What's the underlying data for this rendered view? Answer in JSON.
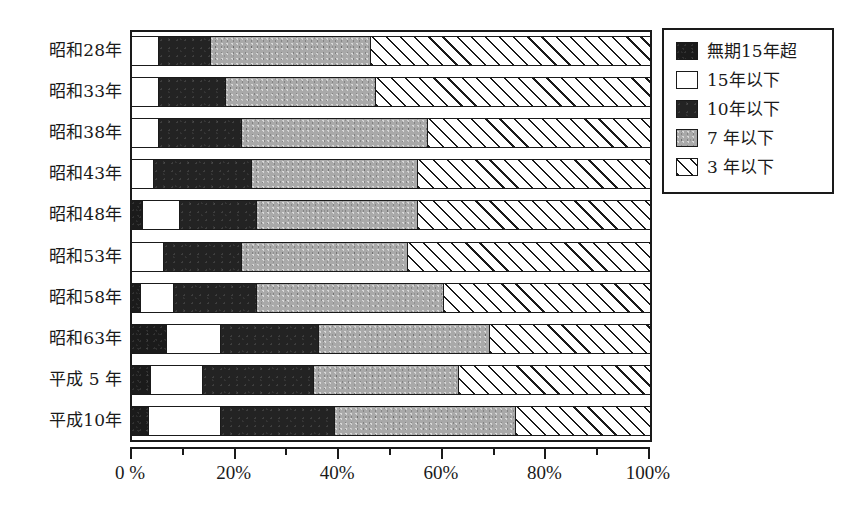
{
  "chart_data": {
    "type": "bar",
    "orientation": "horizontal",
    "stacked": true,
    "normalized_percent": true,
    "title": "",
    "xlabel": "",
    "ylabel": "",
    "xlim": [
      0,
      100
    ],
    "grid": false,
    "legend_position": "right",
    "categories": [
      "昭和28年",
      "昭和33年",
      "昭和38年",
      "昭和43年",
      "昭和48年",
      "昭和53年",
      "昭和58年",
      "昭和63年",
      "平成 5 年",
      "平成10年"
    ],
    "xticks": [
      0,
      20,
      40,
      60,
      80,
      100
    ],
    "xticklabels": [
      "0 %",
      "20%",
      "40%",
      "60%",
      "80%",
      "100%"
    ],
    "xminorticks": [
      10,
      30,
      50,
      70,
      90
    ],
    "series": [
      {
        "name": "無期15年超",
        "fill": "s-black",
        "values": [
          0.0,
          0.0,
          0.0,
          0.0,
          2.0,
          0.0,
          1.5,
          6.5,
          3.5,
          3.0
        ]
      },
      {
        "name": "15年以下",
        "fill": "s-white",
        "values": [
          5.0,
          5.0,
          5.0,
          4.0,
          7.0,
          6.0,
          6.5,
          10.5,
          10.0,
          14.0
        ]
      },
      {
        "name": "10年以下",
        "fill": "s-dark",
        "values": [
          10.0,
          13.0,
          16.0,
          19.0,
          15.0,
          15.0,
          16.0,
          19.0,
          21.5,
          22.0
        ]
      },
      {
        "name": "7 年以下",
        "fill": "s-gray",
        "values": [
          31.0,
          29.0,
          36.0,
          32.0,
          31.0,
          32.0,
          36.0,
          33.0,
          28.0,
          35.0
        ]
      },
      {
        "name": "3 年以下",
        "fill": "s-hatch",
        "values": [
          54.0,
          53.0,
          43.0,
          45.0,
          45.0,
          47.0,
          40.0,
          31.0,
          37.0,
          26.0
        ]
      }
    ]
  }
}
